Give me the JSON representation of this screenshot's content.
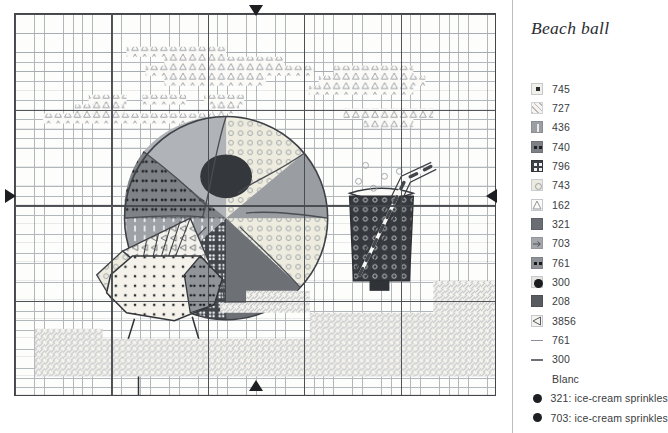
{
  "document": {
    "type": "cross-stitch-pattern-chart",
    "title": "Beach ball"
  },
  "legend": {
    "title": "Beach ball",
    "entries": [
      {
        "code": "745",
        "symbol": "small-filled-square",
        "swatch": "#f2f0ea",
        "symbol_color": "#2a2c2f",
        "kind": "block"
      },
      {
        "code": "727",
        "symbol": "diagonal-hatch",
        "swatch": "#f6f4ec",
        "symbol_color": "#b6bac0",
        "kind": "block"
      },
      {
        "code": "436",
        "symbol": "vertical-bar",
        "swatch": "#9b9ea3",
        "symbol_color": "#e9eaec",
        "kind": "block"
      },
      {
        "code": "740",
        "symbol": "two-dots",
        "swatch": "#7d8186",
        "symbol_color": "#1e2023",
        "kind": "block"
      },
      {
        "code": "796",
        "symbol": "four-dots",
        "swatch": "#3d4044",
        "symbol_color": "#f0f1f2",
        "kind": "block"
      },
      {
        "code": "743",
        "symbol": "small-circle",
        "swatch": "#eceade",
        "symbol_color": "#9aa0a6",
        "kind": "block"
      },
      {
        "code": "162",
        "symbol": "triangle-outline",
        "swatch": "#fbfaf6",
        "symbol_color": "#8e949b",
        "kind": "block"
      },
      {
        "code": "321",
        "symbol": "solid-fill",
        "swatch": "#6a6d72",
        "symbol_color": "#6a6d72",
        "kind": "block"
      },
      {
        "code": "703",
        "symbol": "right-arrow",
        "swatch": "#a4a7ac",
        "symbol_color": "#4a4d51",
        "kind": "block"
      },
      {
        "code": "761",
        "symbol": "two-dots",
        "swatch": "#8e9297",
        "symbol_color": "#17191b",
        "kind": "block"
      },
      {
        "code": "300",
        "symbol": "filled-circle",
        "swatch": "#e6e5e0",
        "symbol_color": "#1a1c1e",
        "kind": "block"
      },
      {
        "code": "208",
        "symbol": "solid-fill",
        "swatch": "#585b60",
        "symbol_color": "#585b60",
        "kind": "block"
      },
      {
        "code": "3856",
        "symbol": "left-triangle",
        "swatch": "#f4f3ee",
        "symbol_color": "#5a5d62",
        "kind": "block"
      },
      {
        "code": "761",
        "symbol": "backstitch-line",
        "swatch": "",
        "symbol_color": "#8c9096",
        "kind": "line"
      },
      {
        "code": "300",
        "symbol": "backstitch-line",
        "swatch": "",
        "symbol_color": "#6e7277",
        "kind": "line"
      },
      {
        "code": "Blanc",
        "symbol": "no-symbol",
        "swatch": "",
        "symbol_color": "",
        "kind": "none"
      },
      {
        "code": "321: ice-cream sprinkles",
        "symbol": "french-knot-dot",
        "swatch": "",
        "symbol_color": "#1d1f22",
        "kind": "knot"
      },
      {
        "code": "703: ice-cream sprinkles",
        "symbol": "french-knot-dot",
        "swatch": "",
        "symbol_color": "#1d1f22",
        "kind": "knot"
      }
    ]
  },
  "chart": {
    "grid": {
      "columns": 50,
      "rows": 40,
      "bold_every": 10,
      "grid_line_color": "#9aa0a6",
      "bold_line_color": "#44474c",
      "background": "#fdfdfc"
    },
    "center_markers": [
      {
        "name": "top-center-marker",
        "position": "top"
      },
      {
        "name": "bottom-center-marker",
        "position": "bottom"
      },
      {
        "name": "left-center-marker",
        "position": "left"
      },
      {
        "name": "right-center-marker",
        "position": "right"
      }
    ],
    "motifs": [
      {
        "name": "beach-ball",
        "description": "large segmented ball with light and dark wedges"
      },
      {
        "name": "sea-shell",
        "description": "fan-shaped scallop shell"
      },
      {
        "name": "ice-cream",
        "description": "dotted scoop with sprinkles on a cone base"
      },
      {
        "name": "drink-glass",
        "description": "dark tumbler with striped straw"
      },
      {
        "name": "clouds",
        "description": "triangle-symbol cloud band across the sky"
      },
      {
        "name": "sand",
        "description": "diagonal hatch band along the lower area"
      }
    ]
  }
}
